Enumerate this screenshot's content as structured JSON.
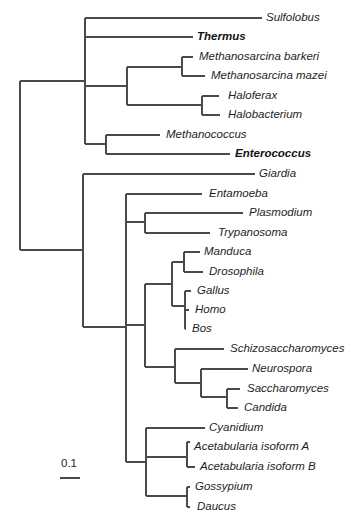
{
  "diagram": {
    "type": "phylogenetic-tree",
    "line_color": "#4a4a4a",
    "scale_bar": {
      "label": "0.1",
      "x1": 60,
      "x2": 80,
      "y": 478,
      "label_x": 61,
      "label_y": 458
    },
    "branches": [
      {
        "x1": 20,
        "y1": 81,
        "x2": 20,
        "y2": 250
      },
      {
        "x1": 20,
        "y1": 81,
        "x2": 85,
        "y2": 81
      },
      {
        "x1": 20,
        "y1": 250,
        "x2": 83,
        "y2": 250
      },
      {
        "x1": 85,
        "y1": 18,
        "x2": 85,
        "y2": 144
      },
      {
        "x1": 85,
        "y1": 18,
        "x2": 262,
        "y2": 18
      },
      {
        "x1": 85,
        "y1": 37,
        "x2": 193,
        "y2": 37
      },
      {
        "x1": 85,
        "y1": 86,
        "x2": 127,
        "y2": 86
      },
      {
        "x1": 85,
        "y1": 144,
        "x2": 106,
        "y2": 144
      },
      {
        "x1": 127,
        "y1": 67,
        "x2": 127,
        "y2": 105
      },
      {
        "x1": 127,
        "y1": 67,
        "x2": 182,
        "y2": 67
      },
      {
        "x1": 127,
        "y1": 105,
        "x2": 202,
        "y2": 105
      },
      {
        "x1": 182,
        "y1": 57,
        "x2": 182,
        "y2": 76
      },
      {
        "x1": 182,
        "y1": 57,
        "x2": 193,
        "y2": 57
      },
      {
        "x1": 182,
        "y1": 76,
        "x2": 205,
        "y2": 76
      },
      {
        "x1": 202,
        "y1": 96,
        "x2": 202,
        "y2": 115
      },
      {
        "x1": 202,
        "y1": 96,
        "x2": 219,
        "y2": 96
      },
      {
        "x1": 202,
        "y1": 115,
        "x2": 220,
        "y2": 115
      },
      {
        "x1": 106,
        "y1": 135,
        "x2": 106,
        "y2": 154
      },
      {
        "x1": 106,
        "y1": 135,
        "x2": 160,
        "y2": 135
      },
      {
        "x1": 106,
        "y1": 154,
        "x2": 230,
        "y2": 154
      },
      {
        "x1": 83,
        "y1": 174,
        "x2": 83,
        "y2": 327
      },
      {
        "x1": 83,
        "y1": 174,
        "x2": 255,
        "y2": 174
      },
      {
        "x1": 83,
        "y1": 327,
        "x2": 126,
        "y2": 327
      },
      {
        "x1": 126,
        "y1": 194,
        "x2": 126,
        "y2": 462
      },
      {
        "x1": 126,
        "y1": 194,
        "x2": 202,
        "y2": 194
      },
      {
        "x1": 126,
        "y1": 222,
        "x2": 145,
        "y2": 222
      },
      {
        "x1": 126,
        "y1": 325,
        "x2": 145,
        "y2": 325
      },
      {
        "x1": 126,
        "y1": 462,
        "x2": 146,
        "y2": 462
      },
      {
        "x1": 145,
        "y1": 213,
        "x2": 145,
        "y2": 233
      },
      {
        "x1": 145,
        "y1": 213,
        "x2": 243,
        "y2": 213
      },
      {
        "x1": 145,
        "y1": 233,
        "x2": 210,
        "y2": 233
      },
      {
        "x1": 145,
        "y1": 284,
        "x2": 145,
        "y2": 367
      },
      {
        "x1": 145,
        "y1": 284,
        "x2": 172,
        "y2": 284
      },
      {
        "x1": 145,
        "y1": 367,
        "x2": 175,
        "y2": 367
      },
      {
        "x1": 172,
        "y1": 262,
        "x2": 172,
        "y2": 306
      },
      {
        "x1": 172,
        "y1": 262,
        "x2": 184,
        "y2": 262
      },
      {
        "x1": 172,
        "y1": 306,
        "x2": 185,
        "y2": 306
      },
      {
        "x1": 184,
        "y1": 252,
        "x2": 184,
        "y2": 272
      },
      {
        "x1": 184,
        "y1": 252,
        "x2": 200,
        "y2": 252
      },
      {
        "x1": 184,
        "y1": 272,
        "x2": 203,
        "y2": 272
      },
      {
        "x1": 185,
        "y1": 291,
        "x2": 185,
        "y2": 329
      },
      {
        "x1": 185,
        "y1": 291,
        "x2": 191,
        "y2": 291
      },
      {
        "x1": 185,
        "y1": 310,
        "x2": 189,
        "y2": 310
      },
      {
        "x1": 185,
        "y1": 329,
        "x2": 186,
        "y2": 329
      },
      {
        "x1": 175,
        "y1": 349,
        "x2": 175,
        "y2": 383
      },
      {
        "x1": 175,
        "y1": 349,
        "x2": 224,
        "y2": 349
      },
      {
        "x1": 175,
        "y1": 383,
        "x2": 201,
        "y2": 383
      },
      {
        "x1": 201,
        "y1": 369,
        "x2": 201,
        "y2": 397
      },
      {
        "x1": 201,
        "y1": 369,
        "x2": 248,
        "y2": 369
      },
      {
        "x1": 201,
        "y1": 397,
        "x2": 227,
        "y2": 397
      },
      {
        "x1": 227,
        "y1": 389,
        "x2": 227,
        "y2": 408
      },
      {
        "x1": 227,
        "y1": 389,
        "x2": 240,
        "y2": 389
      },
      {
        "x1": 227,
        "y1": 408,
        "x2": 238,
        "y2": 408
      },
      {
        "x1": 146,
        "y1": 428,
        "x2": 146,
        "y2": 496
      },
      {
        "x1": 146,
        "y1": 428,
        "x2": 205,
        "y2": 428
      },
      {
        "x1": 146,
        "y1": 457,
        "x2": 187,
        "y2": 457
      },
      {
        "x1": 146,
        "y1": 496,
        "x2": 187,
        "y2": 496
      },
      {
        "x1": 187,
        "y1": 442,
        "x2": 187,
        "y2": 467
      },
      {
        "x1": 187,
        "y1": 442,
        "x2": 190,
        "y2": 442
      },
      {
        "x1": 187,
        "y1": 467,
        "x2": 195,
        "y2": 467
      },
      {
        "x1": 187,
        "y1": 487,
        "x2": 187,
        "y2": 507
      },
      {
        "x1": 187,
        "y1": 487,
        "x2": 190,
        "y2": 487
      },
      {
        "x1": 187,
        "y1": 507,
        "x2": 190,
        "y2": 507
      }
    ],
    "taxa": [
      {
        "label": "Sulfolobus",
        "x": 266,
        "y": 18,
        "bold": false
      },
      {
        "label": "Thermus",
        "x": 197,
        "y": 37,
        "bold": true
      },
      {
        "label": "Methanosarcina barkeri",
        "x": 199,
        "y": 57,
        "bold": false
      },
      {
        "label": "Methanosarcina mazei",
        "x": 211,
        "y": 76,
        "bold": false
      },
      {
        "label": "Haloferax",
        "x": 228,
        "y": 96,
        "bold": false
      },
      {
        "label": "Halobacterium",
        "x": 228,
        "y": 115,
        "bold": false
      },
      {
        "label": "Methanococcus",
        "x": 166,
        "y": 135,
        "bold": false
      },
      {
        "label": "Enterococcus",
        "x": 235,
        "y": 154,
        "bold": true
      },
      {
        "label": "Giardia",
        "x": 259,
        "y": 174,
        "bold": false
      },
      {
        "label": "Entamoeba",
        "x": 209,
        "y": 194,
        "bold": false
      },
      {
        "label": "Plasmodium",
        "x": 249,
        "y": 213,
        "bold": false
      },
      {
        "label": "Trypanosoma",
        "x": 218,
        "y": 233,
        "bold": false
      },
      {
        "label": "Manduca",
        "x": 204,
        "y": 252,
        "bold": false
      },
      {
        "label": "Drosophila",
        "x": 209,
        "y": 272,
        "bold": false
      },
      {
        "label": "Gallus",
        "x": 197,
        "y": 291,
        "bold": false
      },
      {
        "label": "Homo",
        "x": 195,
        "y": 310,
        "bold": false
      },
      {
        "label": "Bos",
        "x": 192,
        "y": 329,
        "bold": false
      },
      {
        "label": "Schizosaccharomyces",
        "x": 230,
        "y": 349,
        "bold": false
      },
      {
        "label": "Neurospora",
        "x": 252,
        "y": 369,
        "bold": false
      },
      {
        "label": "Saccharomyces",
        "x": 247,
        "y": 389,
        "bold": false
      },
      {
        "label": "Candida",
        "x": 244,
        "y": 408,
        "bold": false
      },
      {
        "label": "Cyanidium",
        "x": 209,
        "y": 428,
        "bold": false
      },
      {
        "label": "Acetabularia isoform A",
        "x": 194,
        "y": 447,
        "bold": false
      },
      {
        "label": "Acetabularia isoform B",
        "x": 200,
        "y": 467,
        "bold": false
      },
      {
        "label": "Gossypium",
        "x": 195,
        "y": 487,
        "bold": false
      },
      {
        "label": "Daucus",
        "x": 197,
        "y": 507,
        "bold": false
      }
    ]
  }
}
